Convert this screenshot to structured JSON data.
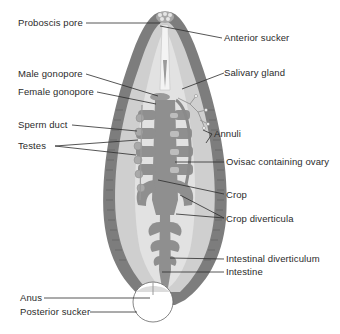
{
  "diagram": {
    "colors": {
      "background": "#ffffff",
      "body_wall": "#7d7d7d",
      "body_inner": "#cfcfcf",
      "body_core": "#e2e2e2",
      "gut": "#8f8f8f",
      "gut_light": "#bdbdbd",
      "leader_line": "#2b2b2b",
      "label_text": "#2b2b2b"
    },
    "labels_left": [
      {
        "id": "proboscis-pore",
        "text": "Proboscis pore"
      },
      {
        "id": "male-gonopore",
        "text": "Male gonopore"
      },
      {
        "id": "female-gonopore",
        "text": "Female gonopore"
      },
      {
        "id": "sperm-duct",
        "text": "Sperm duct"
      },
      {
        "id": "testes",
        "text": "Testes"
      },
      {
        "id": "anus",
        "text": "Anus"
      },
      {
        "id": "posterior-sucker",
        "text": "Posterior sucker"
      }
    ],
    "labels_right": [
      {
        "id": "anterior-sucker",
        "text": "Anterior sucker"
      },
      {
        "id": "salivary-gland",
        "text": "Salivary gland"
      },
      {
        "id": "annuli",
        "text": "Annuli"
      },
      {
        "id": "ovisac",
        "text": "Ovisac containing ovary"
      },
      {
        "id": "crop",
        "text": "Crop"
      },
      {
        "id": "crop-diverticula",
        "text": "Crop diverticula"
      },
      {
        "id": "intestinal-diverticulum",
        "text": "Intestinal diverticulum"
      },
      {
        "id": "intestine",
        "text": "Intestine"
      }
    ]
  }
}
